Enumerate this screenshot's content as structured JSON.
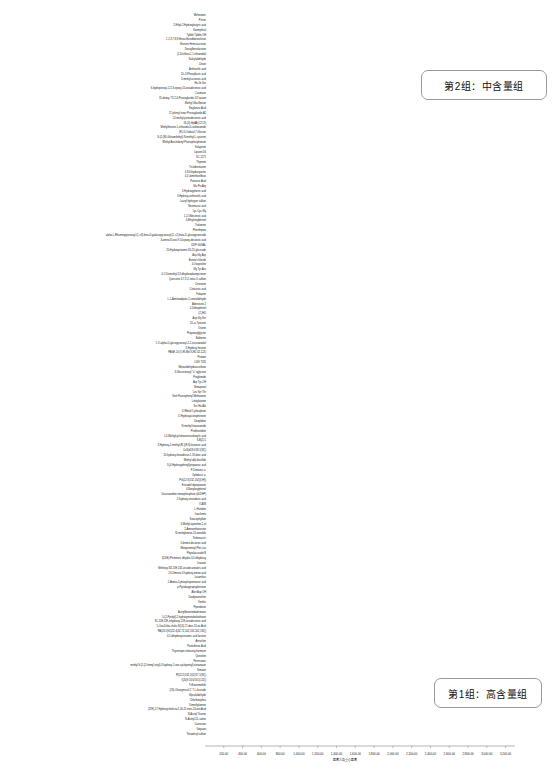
{
  "figure": {
    "type": "dendrogram",
    "orientation": "horizontal",
    "line_color": "#a6a6a6"
  },
  "axis": {
    "title": "距离三角重心距离",
    "ticks": [
      "200.00",
      "400.00",
      "600.00",
      "800.00",
      "1,000.00",
      "1,200.00",
      "1,400.00",
      "1,600.00",
      "1,800.00",
      "2,000.00",
      "2,200.00",
      "2,400.00",
      "2,600.00",
      "2,800.00",
      "3,000.00",
      "3,200.00"
    ],
    "min": 0,
    "max": 3300
  },
  "callouts": [
    {
      "id": "group2",
      "label": "第2组：中含量组"
    },
    {
      "id": "group1",
      "label": "第1组：高含量组"
    }
  ],
  "leaves": [
    "Mefenamic",
    "Purine",
    "2-Ethyl-2-Hydroxybutyric acid",
    "Kaempferol",
    "Tyldile Tyldile-OH",
    "1,2,3,7,8,9-Hexachlorodibenzofuran",
    "Estrone Hemisuccinate",
    "Deoxylbenzlactone",
    "(2-Dichloro-1,1-ethanediol",
    "Salicylaldehyde",
    "Citrate",
    "Anthranilic acid",
    "DL-3-Phenyllactic acid",
    "3-methyl-octanoic acid",
    "His Ile Ser",
    "6-hydroperoxy-12,13-epoxy-10-octadecenoic acid",
    "Coumarin",
    "15-deoxy-?12,14-Prostaglandin D2 lactam",
    "Methyl Glucillonate",
    "Stoglutaric Acid",
    "17-phenyl trinor Prostaglandin A2",
    "13-methyl-pentadecanoic acid",
    "18-(3)-HpAA (12:13)",
    "Methylhistone-1-ethoxide-4-carboxamide",
    "(R)-3-Oxidizol-7-Glucine",
    "S-(2-(N5-Glutamilethyl)-N-methyl-L-cysteine",
    "Methyl Arachidonyl Fluorophosphonate",
    "Solupenin",
    "Lipoxin D4",
    "SC-1271",
    "Thymine",
    "Triclobentazine",
    "4,8-Dihydrosparine",
    "4,4'-dimethoxfibrae",
    "Panoseic Acid",
    "Glu Pro Arg",
    "3-Hydroxyphenic acid",
    "3-Hydroxy-anthranilic acid",
    "Lauryl hydrogen sulfate",
    "Neomassic acid",
    "Lys Cys Gly",
    "1,2-Oldecenoic acid",
    "4-Ethylvinylphenol",
    "Trolamine",
    "Phenthipion",
    "alpha-L-Rhamnopyranosyl-(1->3)-beta-D-galactopyranosyl-(1->2)-beta-D-glucopyranoside",
    "3-amino-8-oxo-9,10-epoxy-decanoic acid",
    "UDP-GlcNAc",
    "25-Hydroxyvitamin D3-25-glucoside",
    "Asp Gly Asp",
    "Benzal chloride",
    "4-Oxoproline",
    "Gly Tyr Asn",
    "4-O-Demethyl-13-dihydroadriamycinone",
    "Quercetin-3,7,3',4'-tetra-O-sulfate",
    "Cerenone",
    "Citraconic acid",
    "Folapine",
    "L-1-Aminoadipate-2-semialdehyde",
    "Adenosine 2",
    "2-Dithiophenol",
    "(Z-)HD",
    "Asp Gly Ser",
    "DL-o-Tyrosine",
    "Ostetin",
    "Propanoylglycine",
    "Baltimine",
    "1-O-alpha-D-glucopyranosyl-1,2-eicosanediol",
    "3-Hydroxy hexane",
    "PAGE-14 (O-R-MeOCH2-3Z-12Z)",
    "Protatin",
    "CGS 7181",
    "Monoaldehydeascorbate",
    "3-Glucuronosyl \"a\" aglycone",
    "Proglumide",
    "Asp Tyr-OH",
    "Bimapexol",
    "Leu Ser Thr",
    "Sinh Fluorophenyl-Methanone",
    "Lottiglutamin",
    "Ser His Ala",
    "D-Ribitol 5-phosphate",
    "4'-Hydroxyacetophenone",
    "Deoplidine",
    "N-methyl hexanamide",
    "Pirolhentidine",
    "1,4-Methylcyclohexanecarboxylic acid",
    "ILB(2)-5",
    "3-Hydroxy-2-methyl-(R-)(R,S)-butanoic acid",
    "CeS(d18:0/18:1(9Z))",
    "10-hydroxy-hexadecan-1,19-dioic acid",
    "Methyl allyl disulfide",
    "3-(4-Hydroxyphenyl)propanoic acid",
    "P-Dimaroic a.",
    "Oploducic a.",
    "PG(22:3(13Z,16Z)(OH))",
    "Estradiol dipropionate",
    "4-Nonyloxyphenol",
    "Docosanidine monophosphate (dLDHP)",
    "2-hydroxy-stearidonic acid",
    "ICAIN",
    "L-Histidine",
    "Istaclomin",
    "Sutacephyllate",
    "3-Methyl-quinoline-2-ol",
    "2-Aminoethanesine",
    "N-methylamino-10-oxindole",
    "Terbinsactic",
    "5-bromo-decanoic acid",
    "Metoprometyl-Phe-Leu",
    "Phytolaccaside B",
    "3(10E)-Pentenoic dihydro-3,4-dihydroxy",
    "Linarate",
    "Methoxy-N2,13E,13Z-octadecanoates acid",
    "2,6-Dimeno-3-hydroxy-amino acid",
    "Losanthus",
    "2-Amino-5-phosphopentanoic acid",
    "p-Pyridoxypropiophenone",
    "Alier Asp-OH",
    "Diadipramorline",
    "Venlitic",
    "Piperidione",
    "Acetylbenzimidadironase",
    "5-(2-Pyridyl)-2-hydroxymetabolitothiono",
    "9C,10E,11E-ethydroxy-12E-octadecenoic acid",
    "5-Oxo-Delta-cholic-8(14),17-dien-24-oic Acid",
    "PA(18:1(9Z)/22:4(4Z,7Z,10Z,13Z,16Z,19Z))",
    "4,5-dihydroxycinnamic acid lactone",
    "Arnucline",
    "Pantothenic Acid",
    "Thyrotropin releasing hormone",
    "Quinoline",
    "Perenzanic",
    "methyl-9-(2-(2-formyl-vinyl)-3-hydroxy-5-oxo-cyclopentyl)-nonanoate",
    "Simazin",
    "PI(22:2(13Z,16Z)/17:1(9Z))",
    "IQD(9:10:0/18:1(11Z))",
    "Trifluoromethile",
    "(2S)-Oleoxymicol-2'-?-L-fucoside",
    "Glycolaldehyde",
    "Chlortheophos",
    "Dimethylamine",
    "(22E)-17-Hydroxycholesta-5,16,22-trien-24-one Acid",
    "N-Acetyl Taurine",
    "N-Acetyl-DL-valine",
    "Carnosine",
    "Goguani",
    "Tetradecyl sulfate"
  ],
  "tree": {
    "note": "Hierarchical clustering tree; merge distances map to the x-axis scale."
  }
}
